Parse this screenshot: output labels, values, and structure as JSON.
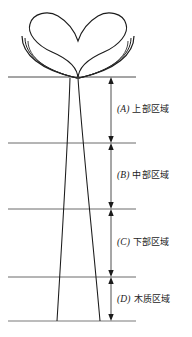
{
  "figure": {
    "title": "",
    "colors": {
      "ink": "#1b1b1b",
      "rule": "#555555",
      "arrow": "#1b1b1b",
      "background": "#ffffff"
    }
  },
  "zones": [
    {
      "key": "(A)",
      "name": "上部区域",
      "label": "(A) 上部区域",
      "top_rule_y": 77,
      "bottom_rule_y": 143
    },
    {
      "key": "(B)",
      "name": "中部区域",
      "label": "(B) 中部区域",
      "top_rule_y": 143,
      "bottom_rule_y": 209
    },
    {
      "key": "(C)",
      "name": "下部区域",
      "label": "(C) 下部区域",
      "top_rule_y": 209,
      "bottom_rule_y": 277
    },
    {
      "key": "(D)",
      "name": "木质区域",
      "label": "(D) 木质区域",
      "top_rule_y": 277,
      "bottom_rule_y": 321
    }
  ],
  "rules": {
    "count": 5,
    "y_positions": [
      77,
      143,
      209,
      277,
      321
    ],
    "x_start": 8,
    "x_end": 136
  },
  "plant": {
    "part_names": [
      "cotyledon-heart",
      "cotyledon-arc-left",
      "cotyledon-arc-right",
      "hypocotyl-stem"
    ],
    "stem_top_x": [
      70,
      78
    ],
    "stem_bottom_x": [
      57,
      100
    ]
  },
  "measure_axis": {
    "x": 111,
    "style": "double-headed-arrow"
  }
}
